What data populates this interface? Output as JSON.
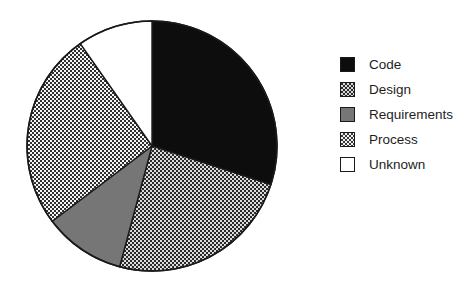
{
  "chart_data": {
    "type": "pie",
    "title": "",
    "subtitle": "",
    "xlabel": "",
    "ylabel": "",
    "grid": false,
    "legend_position": "right",
    "start_angle_deg": 0,
    "direction": "clockwise",
    "center": {
      "x": 152,
      "y": 146
    },
    "radius": 125,
    "categories": [
      "Code",
      "Design",
      "Requirements",
      "Process",
      "Unknown"
    ],
    "values": [
      30,
      24,
      11,
      25,
      10
    ],
    "units": "percent",
    "slices": [
      {
        "label": "Code",
        "value": 30,
        "start_deg": 0,
        "end_deg": 108,
        "fill": "solid",
        "color": "#0d0d0d",
        "swatch_style": "sw-solid-black"
      },
      {
        "label": "Design",
        "value": 24,
        "start_deg": 108,
        "end_deg": 195,
        "fill": "checker-dark",
        "color": "#2a2a2a",
        "swatch_style": "sw-checker-dark"
      },
      {
        "label": "Requirements",
        "value": 11,
        "start_deg": 195,
        "end_deg": 233,
        "fill": "solid",
        "color": "#767676",
        "swatch_style": "sw-solid-gray"
      },
      {
        "label": "Process",
        "value": 25,
        "start_deg": 233,
        "end_deg": 325,
        "fill": "checker-light",
        "color": "#f2f2f2",
        "swatch_style": "sw-checker-light"
      },
      {
        "label": "Unknown",
        "value": 10,
        "start_deg": 325,
        "end_deg": 360,
        "fill": "solid",
        "color": "#ffffff",
        "swatch_style": "sw-white"
      }
    ]
  },
  "legend": {
    "items": [
      {
        "label": "Code",
        "swatch": "sw-solid-black"
      },
      {
        "label": "Design",
        "swatch": "sw-checker-dark"
      },
      {
        "label": "Requirements",
        "swatch": "sw-solid-gray"
      },
      {
        "label": "Process",
        "swatch": "sw-checker-light"
      },
      {
        "label": "Unknown",
        "swatch": "sw-white"
      }
    ]
  },
  "colors": {
    "background": "#ffffff",
    "outline": "#1a1a1a",
    "code": "#0d0d0d",
    "design": "#2a2a2a",
    "requirements": "#767676",
    "process": "#f2f2f2",
    "unknown": "#ffffff",
    "text": "#1d1d1d"
  }
}
